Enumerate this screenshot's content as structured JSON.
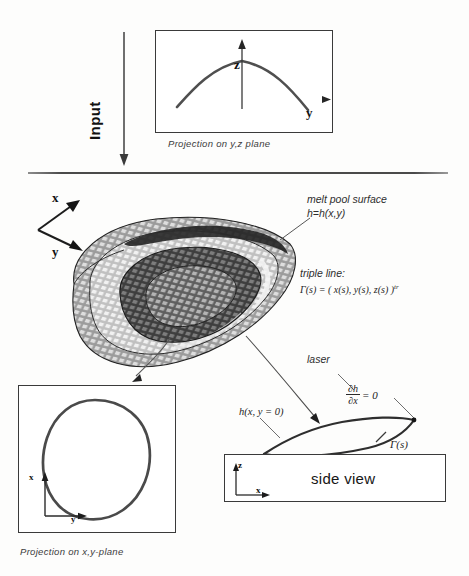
{
  "figure": {
    "background_color": "#fdfdfc",
    "ink_color": "#2a2a2a"
  },
  "input_flow": {
    "label": "Input",
    "arrow_direction": "down"
  },
  "top_panel": {
    "caption": "Projection on y,z plane",
    "vertical_axis_label": "z",
    "horizontal_axis_label": "y",
    "curve_description": "dome shaped free surface profile"
  },
  "main_view": {
    "axis_x_label": "x",
    "axis_y_label": "y",
    "annotations": [
      {
        "name": "melt-pool-surface",
        "line1": "melt pool surface",
        "line2": "h=h(x,y)"
      },
      {
        "name": "triple-line",
        "line1": "triple line:",
        "line2": "Γ(s) = ( x(s), y(s), z(s) )",
        "superscript": "tr"
      }
    ]
  },
  "bottom_left_panel": {
    "caption": "Projection on x,y-plane",
    "vertical_axis_label": "x",
    "horizontal_axis_label": "y",
    "curve_description": "closed triple line loop"
  },
  "side_view_panel": {
    "title": "side view",
    "vertical_axis_label": "z",
    "horizontal_axis_label": "x",
    "annotations": [
      {
        "name": "laser",
        "text": "laser"
      },
      {
        "name": "slope-condition",
        "numerator": "∂h",
        "denominator": "∂x",
        "equals": "= 0"
      },
      {
        "name": "height-profile",
        "text": "h(x, y = 0)"
      },
      {
        "name": "triple-line-point",
        "text": "Γ(s)"
      }
    ]
  }
}
